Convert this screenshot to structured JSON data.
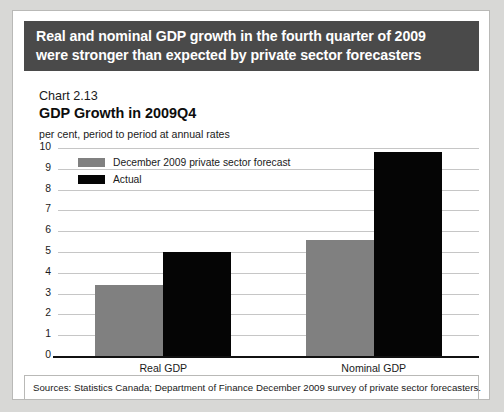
{
  "banner": {
    "line1": "Real and nominal GDP growth in the fourth quarter of 2009",
    "line2": "were stronger than expected by private sector forecasters",
    "background_color": "#4a4a4a",
    "text_color": "#ffffff"
  },
  "chart_number": "Chart 2.13",
  "source_note": "Sources: Statistics Canada; Department of Finance December 2009 survey of private sector forecasters.",
  "colors": {
    "forecast": "#808080",
    "actual": "#050505",
    "gridline": "#c6c6c6",
    "axis": "#111111",
    "page_background": "#d8d8d6"
  },
  "chart_data": {
    "type": "bar",
    "title": "GDP Growth in 2009Q4",
    "subtitle": "per cent, period to period at annual rates",
    "xlabel": "",
    "ylabel": "",
    "categories": [
      "Real GDP",
      "Nominal GDP"
    ],
    "series": [
      {
        "name": "December 2009 private sector forecast",
        "color": "#808080",
        "values": [
          3.4,
          5.6
        ]
      },
      {
        "name": "Actual",
        "color": "#050505",
        "values": [
          5.0,
          9.8
        ]
      }
    ],
    "ylim": [
      0,
      10
    ],
    "ytick_step": 1,
    "yticks": [
      "10",
      "9",
      "8",
      "7",
      "6",
      "5",
      "4",
      "3",
      "2",
      "1",
      "0"
    ],
    "grid": true,
    "legend_position": "top-left"
  }
}
